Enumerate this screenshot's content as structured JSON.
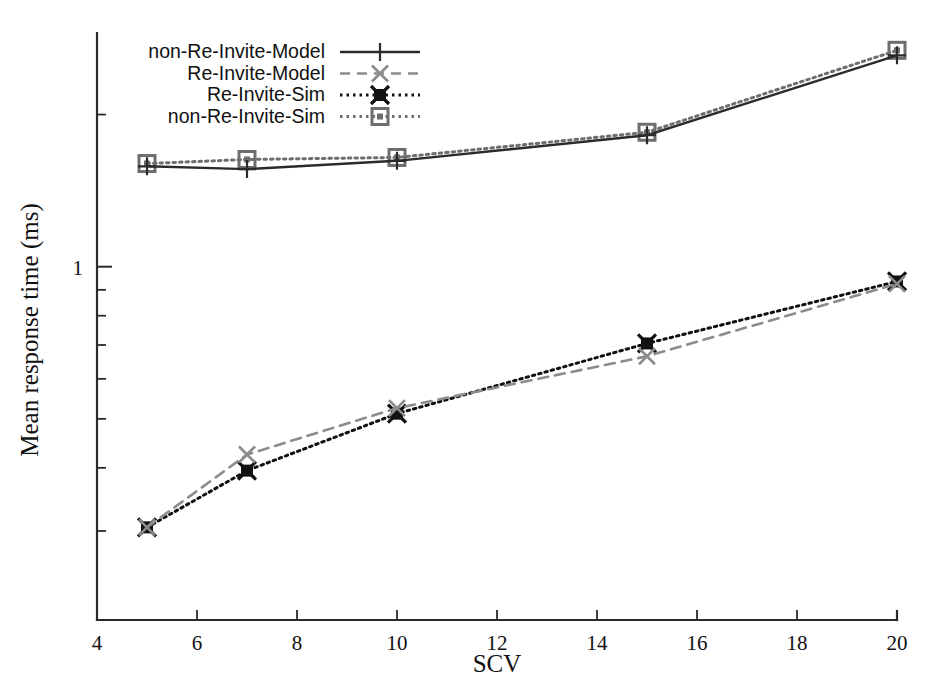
{
  "chart_data": {
    "type": "line",
    "title": "",
    "xlabel": "SCV",
    "ylabel": "Mean response time (ms)",
    "xscale": "linear",
    "yscale": "log",
    "xlim": [
      4,
      20
    ],
    "ylim": [
      0.2,
      2.9
    ],
    "xticks": [
      4,
      6,
      8,
      10,
      12,
      14,
      16,
      18,
      20
    ],
    "xticklabels": [
      "4",
      "6",
      "8",
      "10",
      "12",
      "14",
      "16",
      "18",
      "20"
    ],
    "yticks_major": [
      1
    ],
    "yticklabels_major": [
      "1"
    ],
    "yticks_minor": [
      0.2,
      0.3,
      0.4,
      0.5,
      0.6,
      0.7,
      0.8,
      0.9,
      2
    ],
    "grid": false,
    "legend_position": "top-left",
    "x": [
      5,
      7,
      10,
      15,
      20
    ],
    "series": [
      {
        "name": "non-Re-Invite-Model",
        "values": [
          1.58,
          1.56,
          1.62,
          1.82,
          2.62
        ],
        "color": "#2b2b2b",
        "linestyle": "solid",
        "marker": "plus"
      },
      {
        "name": "Re-Invite-Model",
        "values": [
          0.305,
          0.425,
          0.525,
          0.665,
          0.925
        ],
        "color": "#8c8c8c",
        "linestyle": "dashed",
        "marker": "x"
      },
      {
        "name": "Re-Invite-Sim",
        "values": [
          0.305,
          0.395,
          0.512,
          0.705,
          0.935
        ],
        "color": "#111111",
        "linestyle": "dotted",
        "marker": "filled-square-star"
      },
      {
        "name": "non-Re-Invite-Sim",
        "values": [
          1.6,
          1.63,
          1.645,
          1.845,
          2.68
        ],
        "color": "#6e6e6e",
        "linestyle": "dotted",
        "marker": "open-square"
      }
    ]
  },
  "legend": {
    "entries": [
      {
        "label": "non-Re-Invite-Model"
      },
      {
        "label": "Re-Invite-Model"
      },
      {
        "label": "Re-Invite-Sim"
      },
      {
        "label": "non-Re-Invite-Sim"
      }
    ]
  }
}
